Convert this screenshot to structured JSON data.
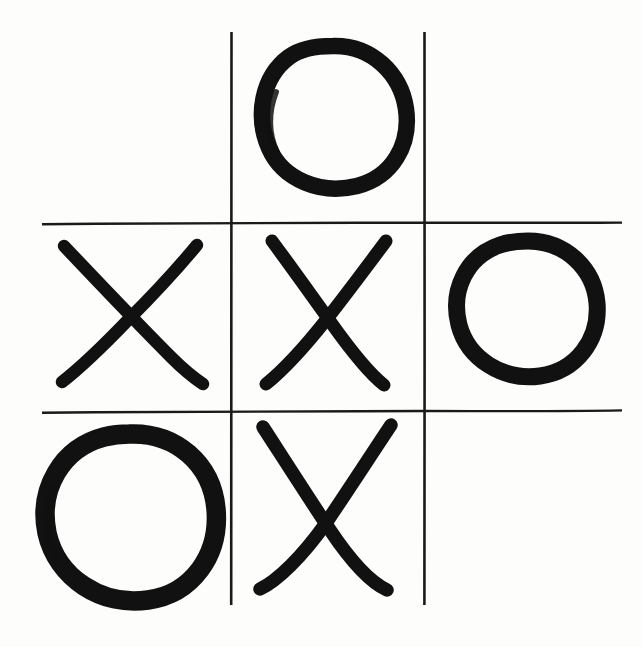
{
  "board": {
    "title": "Tic Tac Toe",
    "style": "hand-drawn",
    "width": 642,
    "height": 647,
    "background_color": "#fdfdfc",
    "ink_color": "#111111",
    "grid_line_color": "#1a1a1a",
    "rows": 3,
    "columns": 3,
    "grid": {
      "vertical_lines": [
        {
          "name": "vertical-line-left",
          "x": 231,
          "y_start": 32,
          "y_end": 605,
          "thickness": 2.4
        },
        {
          "name": "vertical-line-right",
          "x": 424,
          "y_start": 32,
          "y_end": 605,
          "thickness": 2.4
        }
      ],
      "horizontal_lines": [
        {
          "name": "horizontal-line-top",
          "y": 223,
          "x_start": 42,
          "x_end": 622,
          "thickness": 2.2
        },
        {
          "name": "horizontal-line-bottom",
          "y": 411,
          "x_start": 42,
          "x_end": 622,
          "thickness": 2.2
        }
      ]
    },
    "cells": [
      {
        "index": 0,
        "row": 0,
        "column": 0,
        "position": "top-left",
        "mark": "",
        "label": "empty"
      },
      {
        "index": 1,
        "row": 0,
        "column": 1,
        "position": "top-center",
        "mark": "O",
        "label": "nought"
      },
      {
        "index": 2,
        "row": 0,
        "column": 2,
        "position": "top-right",
        "mark": "",
        "label": "empty"
      },
      {
        "index": 3,
        "row": 1,
        "column": 0,
        "position": "middle-left",
        "mark": "X",
        "label": "cross"
      },
      {
        "index": 4,
        "row": 1,
        "column": 1,
        "position": "middle-center",
        "mark": "X",
        "label": "cross"
      },
      {
        "index": 5,
        "row": 1,
        "column": 2,
        "position": "middle-right",
        "mark": "O",
        "label": "nought"
      },
      {
        "index": 6,
        "row": 2,
        "column": 0,
        "position": "bottom-left",
        "mark": "O",
        "label": "nought"
      },
      {
        "index": 7,
        "row": 2,
        "column": 1,
        "position": "bottom-center",
        "mark": "X",
        "label": "cross"
      },
      {
        "index": 8,
        "row": 2,
        "column": 2,
        "position": "bottom-right",
        "mark": "",
        "label": "empty"
      }
    ],
    "mark_counts": {
      "X": 3,
      "O": 3,
      "empty": 3
    }
  }
}
